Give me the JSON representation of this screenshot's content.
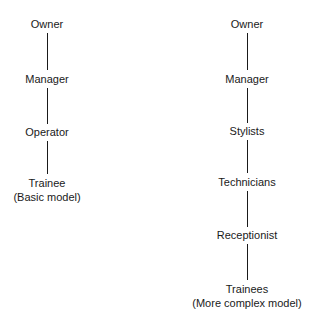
{
  "basic_model": {
    "nodes": [
      "Owner",
      "Manager",
      "Operator",
      "Trainee"
    ],
    "caption": "(Basic model)"
  },
  "complex_model": {
    "nodes": [
      "Owner",
      "Manager",
      "Stylists",
      "Technicians",
      "Receptionist",
      "Trainees"
    ],
    "caption": "(More complex model)"
  }
}
